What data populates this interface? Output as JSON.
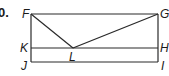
{
  "problem_number": "0.",
  "points": {
    "F": {
      "label": "F",
      "x": 31,
      "y": 14
    },
    "G": {
      "label": "G",
      "x": 158,
      "y": 14
    },
    "K": {
      "label": "K",
      "x": 31,
      "y": 48
    },
    "H": {
      "label": "H",
      "x": 158,
      "y": 48
    },
    "J": {
      "label": "J",
      "x": 31,
      "y": 62
    },
    "I": {
      "label": "I",
      "x": 158,
      "y": 62
    },
    "L": {
      "label": "L",
      "x": 73,
      "y": 48
    }
  },
  "segments": [
    [
      "F",
      "G"
    ],
    [
      "F",
      "J"
    ],
    [
      "G",
      "I"
    ],
    [
      "K",
      "H"
    ],
    [
      "J",
      "I"
    ],
    [
      "F",
      "L"
    ],
    [
      "L",
      "G"
    ]
  ],
  "colors": {
    "stroke": "#2a2a2a",
    "text": "#1a1a1a",
    "background": "#ffffff"
  }
}
